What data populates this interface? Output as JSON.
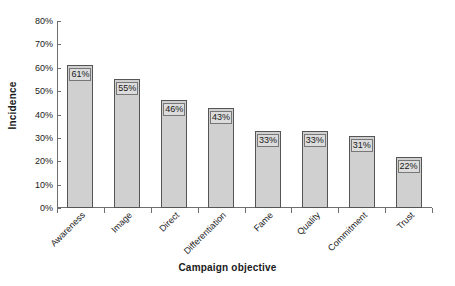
{
  "chart_data": {
    "type": "bar",
    "title": "",
    "subtitle": "",
    "xlabel": "Campaign objective",
    "ylabel": "Incidence",
    "categories": [
      "Awareness",
      "Image",
      "Direct",
      "Differentiation",
      "Fame",
      "Quality",
      "Commitment",
      "Trust"
    ],
    "values": [
      61,
      55,
      46,
      43,
      33,
      33,
      31,
      22
    ],
    "data_labels": [
      "61%",
      "55%",
      "46%",
      "43%",
      "33%",
      "33%",
      "31%",
      "22%"
    ],
    "ylim": [
      0,
      80
    ],
    "ytick_values": [
      0,
      10,
      20,
      30,
      40,
      50,
      60,
      70,
      80
    ],
    "ytick_labels": [
      "0%",
      "10%",
      "20%",
      "30%",
      "40%",
      "50%",
      "60%",
      "70%",
      "80%"
    ],
    "grid": false,
    "legend": false,
    "legend_position": "none",
    "xtick_rotation": -45,
    "bar_fill_color": "#d0d0d0",
    "bar_border_color": "#555555",
    "label_box_fill": "#dcdcdc",
    "label_box_border": "#777777",
    "axis_color": "#6e6e6e",
    "background_color": "#ffffff",
    "text_color": "#1a1a1a"
  }
}
